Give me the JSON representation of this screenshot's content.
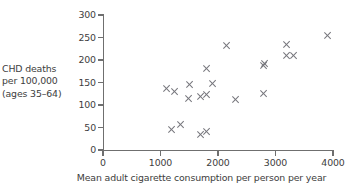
{
  "chart_data": {
    "type": "scatter",
    "title": "",
    "xlabel": "Mean adult cigarette consumption per person per year",
    "ylabel": "CHD deaths per 100,000 (ages 35–64)",
    "ylabel_lines": [
      "CHD deaths",
      "per 100,000",
      "(ages 35–64)"
    ],
    "xlim": [
      0,
      4000
    ],
    "ylim": [
      0,
      300
    ],
    "xticks": [
      0,
      1000,
      2000,
      3000,
      4000
    ],
    "yticks": [
      0,
      50,
      100,
      150,
      200,
      250,
      300
    ],
    "xtick_labels": [
      "0",
      "1000",
      "2000",
      "3000",
      "4000"
    ],
    "ytick_labels": [
      "0",
      "50",
      "100",
      "150",
      "200",
      "250",
      "300"
    ],
    "grid": false,
    "legend": null,
    "marker": "x",
    "marker_color": "#76767c",
    "axis_color": "#6f6f6f",
    "background_color": "#ffffff",
    "points": [
      {
        "x": 1100,
        "y": 137
      },
      {
        "x": 1250,
        "y": 130
      },
      {
        "x": 1200,
        "y": 45
      },
      {
        "x": 1350,
        "y": 57
      },
      {
        "x": 1500,
        "y": 145
      },
      {
        "x": 1490,
        "y": 115
      },
      {
        "x": 1700,
        "y": 118
      },
      {
        "x": 1700,
        "y": 35
      },
      {
        "x": 1800,
        "y": 41
      },
      {
        "x": 1800,
        "y": 123
      },
      {
        "x": 1810,
        "y": 181
      },
      {
        "x": 1900,
        "y": 148
      },
      {
        "x": 2150,
        "y": 232
      },
      {
        "x": 2300,
        "y": 112
      },
      {
        "x": 2790,
        "y": 188
      },
      {
        "x": 2820,
        "y": 192
      },
      {
        "x": 2800,
        "y": 125
      },
      {
        "x": 3200,
        "y": 235
      },
      {
        "x": 3200,
        "y": 211
      },
      {
        "x": 3310,
        "y": 211
      },
      {
        "x": 3900,
        "y": 255
      }
    ]
  }
}
